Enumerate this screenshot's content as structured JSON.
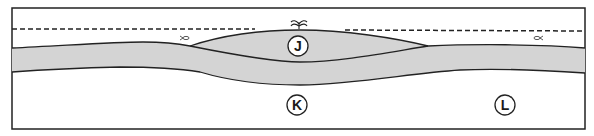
{
  "diagram": {
    "type": "geologic-cross-section",
    "colors": {
      "frame": "#222222",
      "layer_fill": "#d4d4d4",
      "line": "#222222",
      "background": "#ffffff"
    },
    "labels": [
      {
        "id": "J",
        "text": "J",
        "location": "lens region beneath spring"
      },
      {
        "id": "K",
        "text": "K",
        "location": "below the layer, center"
      },
      {
        "id": "L",
        "text": "L",
        "location": "below the layer, right"
      }
    ],
    "icons": [
      {
        "name": "spring-icon",
        "location": "top of lens at J"
      },
      {
        "name": "fish-icon-left",
        "location": "left of lens above layer"
      },
      {
        "name": "fish-icon-right",
        "location": "right side above layer"
      }
    ],
    "dashed_line": "water-level"
  }
}
